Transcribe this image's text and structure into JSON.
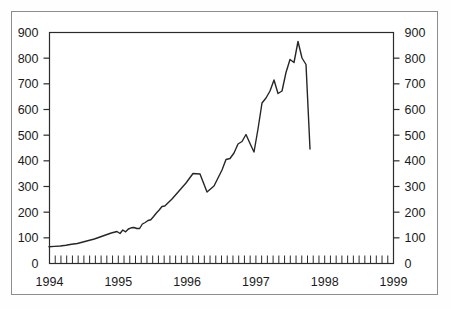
{
  "chart_data": {
    "type": "line",
    "title": "",
    "subtitle": "",
    "xlabel": "",
    "ylabel": "",
    "ylim": [
      0,
      900
    ],
    "ylim_right": [
      0,
      900
    ],
    "yticks": [
      0,
      100,
      200,
      300,
      400,
      500,
      600,
      700,
      800,
      900
    ],
    "yticks_right": [
      0,
      100,
      200,
      300,
      400,
      500,
      600,
      700,
      800,
      900
    ],
    "xticks_major": [
      "1994",
      "1995",
      "1996",
      "1997",
      "1998",
      "1999"
    ],
    "x_minor_tick_interval": "month",
    "x_minor_tick_count": 61,
    "grid": false,
    "legend": null,
    "legend_position": "none",
    "line_color": "#262626",
    "line_width": 1.4,
    "axis_color": "#2b2b2b",
    "frame_color": "#8d8d8d",
    "dual_axis": true,
    "x": [
      "1994-01",
      "1994-02",
      "1994-03",
      "1994-04",
      "1994-05",
      "1994-06",
      "1994-07",
      "1994-08",
      "1994-09",
      "1994-10",
      "1994-11",
      "1994-12",
      "1995-01",
      "1995-02",
      "1995-03",
      "1995-04",
      "1995-05",
      "1995-06",
      "1995-07",
      "1995-08",
      "1995-09",
      "1995-10",
      "1995-11",
      "1995-12",
      "1996-01",
      "1996-02",
      "1996-03",
      "1996-04",
      "1996-05",
      "1996-06",
      "1996-07",
      "1996-08",
      "1996-09",
      "1996-10",
      "1996-11",
      "1996-12",
      "1997-01",
      "1997-02",
      "1997-03",
      "1997-04",
      "1997-05",
      "1997-06",
      "1997-07",
      "1997-08",
      "1997-09",
      "1997-10",
      "1997-11",
      "1997-12",
      "1998-01",
      "1998-02",
      "1998-03",
      "1998-04",
      "1998-05",
      "1998-06",
      "1998-07",
      "1998-08",
      "1998-09",
      "1998-10",
      "1998-11",
      "1998-12",
      "1999-01"
    ],
    "values": [
      63,
      64,
      66,
      68,
      72,
      75,
      80,
      84,
      86,
      95,
      103,
      112,
      118,
      115,
      124,
      120,
      130,
      134,
      135,
      132,
      132,
      148,
      155,
      163,
      165,
      178,
      190,
      203,
      216,
      218,
      245,
      275,
      305,
      347,
      345,
      278,
      300,
      330,
      360,
      400,
      405,
      425,
      460,
      470,
      497,
      462,
      428,
      520,
      620,
      640,
      670,
      710,
      658,
      668,
      740,
      790,
      778,
      862,
      800,
      775,
      450
    ],
    "series": [
      {
        "name": "index",
        "values": [
          63,
          64,
          66,
          68,
          72,
          75,
          80,
          84,
          86,
          95,
          103,
          112,
          118,
          115,
          124,
          120,
          130,
          134,
          135,
          132,
          132,
          148,
          155,
          163,
          165,
          178,
          190,
          203,
          216,
          218,
          245,
          275,
          305,
          347,
          345,
          278,
          300,
          330,
          360,
          400,
          405,
          425,
          460,
          470,
          497,
          462,
          428,
          520,
          620,
          640,
          670,
          710,
          658,
          668,
          740,
          790,
          778,
          862,
          800,
          775,
          450
        ]
      }
    ],
    "annotations": [
      {
        "label": "start",
        "x": "1994-01",
        "y": 63
      },
      {
        "label": "local peak",
        "x": "1996-10",
        "y": 347
      },
      {
        "label": "local trough",
        "x": "1996-12",
        "y": 278
      },
      {
        "label": "local peak",
        "x": "1997-09",
        "y": 497
      },
      {
        "label": "local trough",
        "x": "1997-11",
        "y": 428
      },
      {
        "label": "maximum",
        "x": "1998-10",
        "y": 862
      },
      {
        "label": "trough",
        "x": "1998-12",
        "y": 435
      },
      {
        "label": "late spike",
        "x": "1999-01",
        "y": 505
      },
      {
        "label": "end",
        "x": "1999-01",
        "y": 450
      }
    ],
    "path_points": [
      [
        49.0,
        246.8
      ],
      [
        54.6,
        246.4
      ],
      [
        60.3,
        246.0
      ],
      [
        66.0,
        245.2
      ],
      [
        71.6,
        244.2
      ],
      [
        77.3,
        243.5
      ],
      [
        83.0,
        242.0
      ],
      [
        88.6,
        240.5
      ],
      [
        94.3,
        239.0
      ],
      [
        100.0,
        237.0
      ],
      [
        105.6,
        235.0
      ],
      [
        111.3,
        233.0
      ],
      [
        117.0,
        231.5
      ],
      [
        120.0,
        233.5
      ],
      [
        122.8,
        230.0
      ],
      [
        125.6,
        231.8
      ],
      [
        128.4,
        229.0
      ],
      [
        131.2,
        227.8
      ],
      [
        134.0,
        227.5
      ],
      [
        136.8,
        228.5
      ],
      [
        139.6,
        228.5
      ],
      [
        142.4,
        224.0
      ],
      [
        145.2,
        222.5
      ],
      [
        148.0,
        220.5
      ],
      [
        150.8,
        219.8
      ],
      [
        153.6,
        216.5
      ],
      [
        156.4,
        213.0
      ],
      [
        159.2,
        210.0
      ],
      [
        162.0,
        206.5
      ],
      [
        164.8,
        206.0
      ],
      [
        172.0,
        199.0
      ],
      [
        179.0,
        191.0
      ],
      [
        186.0,
        183.0
      ],
      [
        193.0,
        173.5
      ],
      [
        200.0,
        174.0
      ],
      [
        207.0,
        192.0
      ],
      [
        214.0,
        186.0
      ],
      [
        218.0,
        178.0
      ],
      [
        222.0,
        170.0
      ],
      [
        226.0,
        159.5
      ],
      [
        230.0,
        158.5
      ],
      [
        234.0,
        153.0
      ],
      [
        238.0,
        144.0
      ],
      [
        242.0,
        141.5
      ],
      [
        246.0,
        134.5
      ],
      [
        250.0,
        143.5
      ],
      [
        254.0,
        152.0
      ],
      [
        258.0,
        129.0
      ],
      [
        262.0,
        103.0
      ],
      [
        266.0,
        98.0
      ],
      [
        270.0,
        91.0
      ],
      [
        274.0,
        80.0
      ],
      [
        278.0,
        93.5
      ],
      [
        282.0,
        91.0
      ],
      [
        286.0,
        72.5
      ],
      [
        290.0,
        59.5
      ],
      [
        294.0,
        62.5
      ],
      [
        298.0,
        41.5
      ],
      [
        302.0,
        58.0
      ],
      [
        306.0,
        64.5
      ],
      [
        310.0,
        149.0
      ]
    ]
  }
}
